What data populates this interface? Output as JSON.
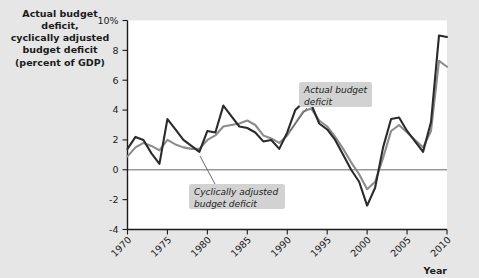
{
  "chart_data": {
    "type": "line",
    "title": "Actual budget deficit,\ncyclically adjusted\nbudget deficit\n(percent of GDP)",
    "xlabel": "Year",
    "ylabel": "",
    "xlim": [
      1970,
      2010
    ],
    "ylim": [
      -4,
      10
    ],
    "grid": false,
    "legend_position": "annotations",
    "xticks": [
      1970,
      1975,
      1980,
      1985,
      1990,
      1995,
      2000,
      2005,
      2010
    ],
    "xtick_labels": [
      "1970",
      "1975",
      "1980",
      "1985",
      "1990",
      "1995",
      "2000",
      "2005",
      "2010"
    ],
    "yticks": [
      -4,
      -2,
      0,
      2,
      4,
      6,
      8,
      10
    ],
    "ytick_labels": [
      "-4",
      "-2",
      "0",
      "2",
      "4",
      "6",
      "8",
      "10%"
    ],
    "zero_line": 0,
    "x": [
      1970,
      1971,
      1972,
      1973,
      1974,
      1975,
      1976,
      1977,
      1978,
      1979,
      1980,
      1981,
      1982,
      1983,
      1984,
      1985,
      1986,
      1987,
      1988,
      1989,
      1990,
      1991,
      1992,
      1993,
      1994,
      1995,
      1996,
      1997,
      1998,
      1999,
      2000,
      2001,
      2002,
      2003,
      2004,
      2005,
      2006,
      2007,
      2008,
      2009,
      2010
    ],
    "series": [
      {
        "name": "Actual budget deficit",
        "color": "#2b2b2b",
        "width": 2.1,
        "values": [
          1.4,
          2.2,
          2.0,
          1.1,
          0.4,
          3.4,
          2.7,
          2.0,
          1.6,
          1.2,
          2.6,
          2.5,
          4.3,
          3.6,
          2.9,
          2.8,
          2.5,
          1.9,
          2.0,
          1.4,
          2.5,
          4.0,
          4.5,
          4.4,
          3.1,
          2.7,
          2.0,
          1.0,
          0.0,
          -0.8,
          -2.4,
          -1.2,
          1.5,
          3.4,
          3.5,
          2.6,
          1.9,
          1.2,
          3.2,
          9.0,
          8.9
        ],
        "style": "solid"
      },
      {
        "name": "Cyclically adjusted budget deficit",
        "color": "#8c8c8c",
        "width": 2.1,
        "values": [
          0.9,
          1.5,
          1.8,
          1.6,
          1.3,
          2.0,
          1.7,
          1.5,
          1.4,
          1.4,
          2.0,
          2.3,
          2.9,
          3.0,
          3.1,
          3.3,
          3.0,
          2.3,
          2.1,
          1.8,
          2.3,
          3.1,
          3.9,
          4.1,
          3.3,
          2.9,
          2.2,
          1.4,
          0.5,
          -0.3,
          -1.3,
          -0.8,
          0.8,
          2.6,
          3.0,
          2.5,
          2.0,
          1.5,
          2.6,
          7.3,
          6.9
        ],
        "style": "solid"
      }
    ],
    "annotations": [
      {
        "name": "actual-budget-deficit",
        "text": "Actual budget\ndeficit",
        "box_x": 299,
        "box_y": 82,
        "box_w": 73,
        "box_h": 25,
        "leader_x1": 307,
        "leader_y1": 108,
        "leader_x2": 290,
        "leader_y2": 131
      },
      {
        "name": "cyclically-adjusted-budget-deficit",
        "text": "Cyclically adjusted\nbudget deficit",
        "box_x": 189,
        "box_y": 184,
        "box_w": 96,
        "box_h": 25,
        "leader_x1": 215,
        "leader_y1": 184,
        "leader_x2": 200,
        "leader_y2": 156
      }
    ]
  },
  "colors": {
    "background": "#e6e6e6",
    "plot_background": "#ffffff",
    "axis": "#1b1b1b",
    "zero_line": "#9a9a9a",
    "actual_line": "#2b2b2b",
    "adjusted_line": "#8c8c8c",
    "callout_background": "#d2d2d2",
    "text": "#1b1b1b"
  }
}
